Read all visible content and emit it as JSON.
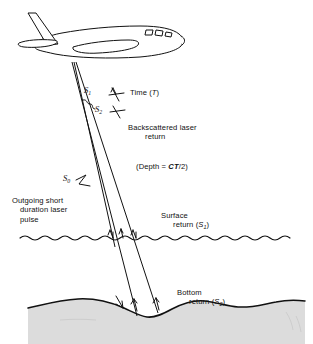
{
  "figure": {
    "type": "schematic-cross-section",
    "background_color": "#ffffff",
    "line_color": "#111111",
    "seabed_fill": "#dcdcdc",
    "water_fill": "#ffffff"
  },
  "labels": {
    "time": "Time (",
    "time_var": "T",
    "time_close": ")",
    "backscatter_line1": "Backscattered laser",
    "backscatter_line2": "return",
    "depth_open": "(Depth = ",
    "depth_formula": "CT",
    "depth_close": "/2)",
    "outgoing_line1": "Outgoing short",
    "outgoing_line2": "duration laser",
    "outgoing_line3": "pulse",
    "surface_line1": "Surface",
    "surface_line2": "return (",
    "surface_var": "S",
    "surface_sub": "1",
    "surface_close": ")",
    "bottom_line1": "Bottom",
    "bottom_line2": "return (",
    "bottom_var": "S",
    "bottom_sub": "2",
    "bottom_close": ")"
  },
  "pulse_markers": {
    "s0": {
      "symbol": "S",
      "subscript": "0",
      "meaning": "outgoing transmitted pulse"
    },
    "s1": {
      "symbol": "S",
      "subscript": "1",
      "meaning": "surface return pulse"
    },
    "s2": {
      "symbol": "S",
      "subscript": "2",
      "meaning": "bottom return pulse"
    }
  },
  "elements": {
    "aircraft": "survey-aircraft",
    "laser_beam": "laser-beam-path",
    "water_surface": "wavy-water-surface-line",
    "seabed": "undulating-seabed-profile",
    "arrows_surface": [
      "down",
      "up",
      "down"
    ],
    "arrows_bottom": [
      "down",
      "up",
      "up"
    ]
  }
}
